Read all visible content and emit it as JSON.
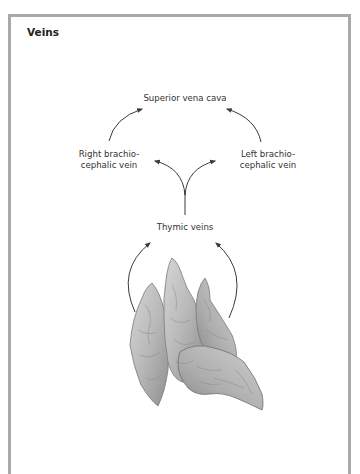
{
  "figure": {
    "title": "Veins",
    "labels": {
      "superior_vena_cava": "Superior vena cava",
      "right_brachiocephalic_vein_line1": "Right brachio-",
      "right_brachiocephalic_vein_line2": "cephalic vein",
      "left_brachiocephalic_vein_line1": "Left brachio-",
      "left_brachiocephalic_vein_line2": "cephalic vein",
      "thymic_veins": "Thymic veins"
    },
    "flow": [
      {
        "from": "Thymus",
        "to": "Thymic veins"
      },
      {
        "from": "Thymic veins",
        "to": "Right brachiocephalic vein"
      },
      {
        "from": "Thymic veins",
        "to": "Left brachiocephalic vein"
      },
      {
        "from": "Right brachiocephalic vein",
        "to": "Superior vena cava"
      },
      {
        "from": "Left brachiocephalic vein",
        "to": "Superior vena cava"
      }
    ],
    "illustration": "thymus",
    "colors": {
      "frame": "#a9a9a9",
      "arrow": "#3a3a3a",
      "organ": "#b5b5b5"
    }
  }
}
